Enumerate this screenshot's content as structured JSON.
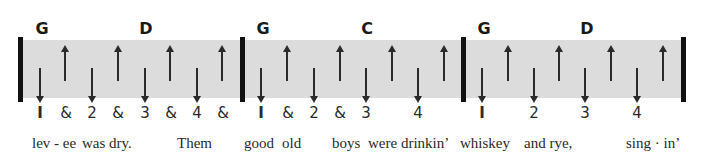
{
  "band_color": "#dcdcdc",
  "bars": [
    18,
    240,
    461,
    681
  ],
  "chords": [
    {
      "label": "G",
      "x": 42
    },
    {
      "label": "D",
      "x": 146
    },
    {
      "label": "G",
      "x": 263
    },
    {
      "label": "C",
      "x": 367
    },
    {
      "label": "G",
      "x": 484
    },
    {
      "label": "D",
      "x": 587
    }
  ],
  "strums": [
    {
      "dir": "down",
      "x": 40
    },
    {
      "dir": "up",
      "x": 65
    },
    {
      "dir": "down",
      "x": 92
    },
    {
      "dir": "up",
      "x": 118
    },
    {
      "dir": "down",
      "x": 145
    },
    {
      "dir": "up",
      "x": 170
    },
    {
      "dir": "down",
      "x": 197
    },
    {
      "dir": "up",
      "x": 222
    },
    {
      "dir": "down",
      "x": 261
    },
    {
      "dir": "up",
      "x": 287
    },
    {
      "dir": "down",
      "x": 314
    },
    {
      "dir": "up",
      "x": 340
    },
    {
      "dir": "down",
      "x": 366
    },
    {
      "dir": "up",
      "x": 392
    },
    {
      "dir": "down",
      "x": 418
    },
    {
      "dir": "up",
      "x": 444
    },
    {
      "dir": "down",
      "x": 482
    },
    {
      "dir": "up",
      "x": 508
    },
    {
      "dir": "down",
      "x": 534
    },
    {
      "dir": "up",
      "x": 559
    },
    {
      "dir": "down",
      "x": 585
    },
    {
      "dir": "up",
      "x": 611
    },
    {
      "dir": "down",
      "x": 637
    },
    {
      "dir": "up",
      "x": 663
    }
  ],
  "beats": [
    {
      "label": "I",
      "x": 40,
      "one": true
    },
    {
      "label": "&",
      "x": 66
    },
    {
      "label": "2",
      "x": 92
    },
    {
      "label": "&",
      "x": 118
    },
    {
      "label": "3",
      "x": 145
    },
    {
      "label": "&",
      "x": 171
    },
    {
      "label": "4",
      "x": 197
    },
    {
      "label": "&",
      "x": 223
    },
    {
      "label": "I",
      "x": 261,
      "one": true
    },
    {
      "label": "&",
      "x": 288
    },
    {
      "label": "2",
      "x": 314
    },
    {
      "label": "&",
      "x": 340
    },
    {
      "label": "3",
      "x": 366
    },
    {
      "label": "4",
      "x": 418
    },
    {
      "label": "I",
      "x": 482,
      "one": true
    },
    {
      "label": "2",
      "x": 534
    },
    {
      "label": "3",
      "x": 585
    },
    {
      "label": "4",
      "x": 637
    }
  ],
  "lyrics": [
    {
      "text": "lev - ee",
      "x": 32
    },
    {
      "text": "was dry.",
      "x": 82
    },
    {
      "text": "Them",
      "x": 177
    },
    {
      "text": "good",
      "x": 244
    },
    {
      "text": "old",
      "x": 282
    },
    {
      "text": "boys",
      "x": 332
    },
    {
      "text": "were drinkin’",
      "x": 368
    },
    {
      "text": "whiskey",
      "x": 460
    },
    {
      "text": "and rye,",
      "x": 524
    },
    {
      "text": "sing · in’",
      "x": 626
    }
  ]
}
